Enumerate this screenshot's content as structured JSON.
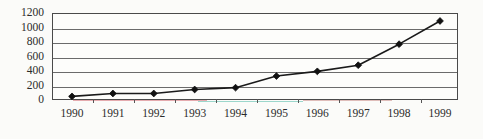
{
  "chart_data": {
    "type": "line",
    "title": "",
    "subtitle": "",
    "xlabel": "",
    "ylabel": "",
    "categories": [
      "1990",
      "1991",
      "1992",
      "1993",
      "1994",
      "1995",
      "1996",
      "1997",
      "1998",
      "1999"
    ],
    "x": [
      1990,
      1991,
      1992,
      1993,
      1994,
      1995,
      1996,
      1997,
      1998,
      1999
    ],
    "values": [
      50,
      90,
      90,
      145,
      170,
      330,
      395,
      480,
      770,
      1090
    ],
    "series": [
      {
        "name": "",
        "values": [
          50,
          90,
          90,
          145,
          170,
          330,
          395,
          480,
          770,
          1090
        ]
      }
    ],
    "ylim": [
      0,
      1200
    ],
    "y_ticks": [
      0,
      200,
      400,
      600,
      800,
      1000,
      1200
    ],
    "y_tick_labels": [
      "0",
      "200",
      "400",
      "600",
      "800",
      "1000",
      "1200"
    ],
    "xlim": [
      "1990",
      "1999"
    ],
    "grid": "horizontal",
    "legend": "none",
    "legend_position": "none",
    "marker": "diamond",
    "line_color": "#1a1a1a",
    "marker_color": "#111111",
    "grid_color": "#6b6b6b",
    "axis_color": "#4a4a4a",
    "plot_background": "#fdfdfb",
    "figure_background": "#fbfbf9",
    "annotations": []
  },
  "figure": {
    "tint_bands": [
      {
        "color": "#d46a72",
        "left_pct": 5,
        "width_pct": 33,
        "y": 86
      },
      {
        "color": "#4fb9a8",
        "left_pct": 36,
        "width_pct": 26,
        "y": 87
      },
      {
        "color": "#c98a86",
        "left_pct": 62,
        "width_pct": 22,
        "y": 86
      }
    ]
  }
}
